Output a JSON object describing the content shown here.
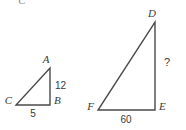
{
  "figure": {
    "clipped_top_glyph": "C",
    "triangles": [
      {
        "id": "small-triangle",
        "vertices": {
          "apex": {
            "label": "A",
            "x": 50,
            "y": 68
          },
          "right_angle": {
            "label": "B",
            "x": 50,
            "y": 105
          },
          "left_base": {
            "label": "C",
            "x": 16,
            "y": 105
          }
        },
        "sides": {
          "vertical_label": "12",
          "horizontal_label": "5"
        }
      },
      {
        "id": "large-triangle",
        "vertices": {
          "apex": {
            "label": "D",
            "x": 155,
            "y": 22
          },
          "right_angle": {
            "label": "E",
            "x": 155,
            "y": 110
          },
          "left_base": {
            "label": "F",
            "x": 98,
            "y": 110
          }
        },
        "sides": {
          "vertical_label": "?",
          "horizontal_label": "60"
        }
      }
    ]
  },
  "colors": {
    "background": "#ffffff",
    "stroke": "#4a4a4a",
    "text": "#3a3a3a"
  }
}
